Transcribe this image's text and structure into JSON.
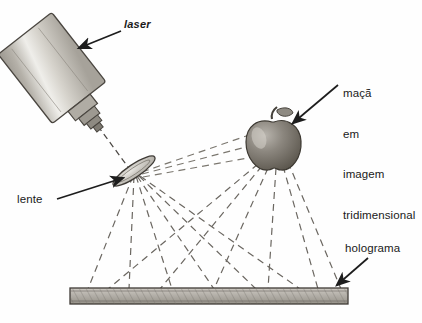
{
  "figure": {
    "kind": "optics-diagram",
    "title_text": "",
    "background_color": "#fefefe",
    "ink_color": "#2b2b2b",
    "width": 422,
    "height": 323
  },
  "labels": {
    "laser": "laser",
    "lente": "lente",
    "holograma": "holograma",
    "apple_lines": [
      "maçã",
      "em",
      "imagem",
      "tridimensional"
    ]
  },
  "objects": {
    "laser_device": "laser-tube",
    "lens": "converging-lens",
    "apple": "apple-3d-image",
    "plate": "holographic-plate"
  },
  "colors": {
    "ink": "#2b2b2b",
    "plate_fill": "#b8b4ad",
    "laser_body": "#c9c6c0",
    "apple_fill": "#8a857e",
    "ray": "#6e6a64"
  }
}
